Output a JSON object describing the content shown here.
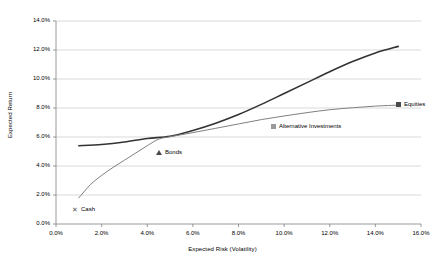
{
  "chart_data": {
    "type": "line",
    "title": "",
    "xlabel": "Expected Risk (Volatility)",
    "ylabel": "Expected Return",
    "xlim": [
      0,
      16
    ],
    "ylim": [
      0,
      14
    ],
    "grid": true,
    "grid_axis": "y",
    "legend_position": "inline-labels",
    "x_ticks": [
      "0.0%",
      "2.0%",
      "4.0%",
      "6.0%",
      "8.0%",
      "10.0%",
      "12.0%",
      "14.0%",
      "16.0%"
    ],
    "y_ticks": [
      "0.0%",
      "2.0%",
      "4.0%",
      "6.0%",
      "8.0%",
      "10.0%",
      "12.0%",
      "14.0%"
    ],
    "x_tick_values": [
      0,
      2,
      4,
      6,
      8,
      10,
      12,
      14,
      16
    ],
    "y_tick_values": [
      0,
      2,
      4,
      6,
      8,
      10,
      12,
      14
    ],
    "series": [
      {
        "name": "Efficient Frontier (steep)",
        "color": "#333333",
        "width": 1.6,
        "points": [
          [
            1.0,
            5.4
          ],
          [
            2.0,
            5.48
          ],
          [
            3.0,
            5.65
          ],
          [
            4.0,
            5.9
          ],
          [
            5.0,
            6.05
          ],
          [
            6.0,
            6.45
          ],
          [
            7.0,
            6.95
          ],
          [
            8.0,
            7.55
          ],
          [
            9.0,
            8.25
          ],
          [
            10.0,
            9.0
          ],
          [
            11.0,
            9.75
          ],
          [
            12.0,
            10.5
          ],
          [
            13.0,
            11.2
          ],
          [
            14.0,
            11.8
          ],
          [
            15.0,
            12.25
          ]
        ]
      },
      {
        "name": "Efficient Frontier (flat)",
        "color": "#808080",
        "width": 1.0,
        "points": [
          [
            1.0,
            1.8
          ],
          [
            1.5,
            2.7
          ],
          [
            2.0,
            3.35
          ],
          [
            2.5,
            3.9
          ],
          [
            3.0,
            4.4
          ],
          [
            3.5,
            4.9
          ],
          [
            4.0,
            5.4
          ],
          [
            4.5,
            5.85
          ],
          [
            5.0,
            6.02
          ],
          [
            6.0,
            6.3
          ],
          [
            7.0,
            6.6
          ],
          [
            8.0,
            6.9
          ],
          [
            9.0,
            7.2
          ],
          [
            10.0,
            7.45
          ],
          [
            11.0,
            7.68
          ],
          [
            12.0,
            7.88
          ],
          [
            13.0,
            8.02
          ],
          [
            14.0,
            8.13
          ],
          [
            15.0,
            8.2
          ]
        ]
      }
    ],
    "annotations": [
      {
        "id": "cash",
        "label": "Cash",
        "marker": "x",
        "x": 1.0,
        "y": 1.8,
        "label_x_px": 72,
        "label_y_px": 206
      },
      {
        "id": "bonds",
        "label": "Bonds",
        "marker": "triangle",
        "x": 4.8,
        "y": 5.0,
        "label_x_px": 156,
        "label_y_px": 149
      },
      {
        "id": "alternative-investments",
        "label": "Alternative Investments",
        "marker": "square",
        "x": 10.0,
        "y": 6.6,
        "label_x_px": 271,
        "label_y_px": 123
      },
      {
        "id": "equities",
        "label": "Equities",
        "marker": "square-dark",
        "x": 15.0,
        "y": 8.2,
        "label_x_px": 396,
        "label_y_px": 101
      }
    ]
  },
  "plot_geometry": {
    "left_px": 56,
    "right_px": 421,
    "top_px": 21,
    "bottom_px": 224
  },
  "colors": {
    "grid": "#c8c8c8",
    "axis": "#808080",
    "series_primary": "#333333",
    "series_secondary": "#808080",
    "text": "#000000"
  }
}
